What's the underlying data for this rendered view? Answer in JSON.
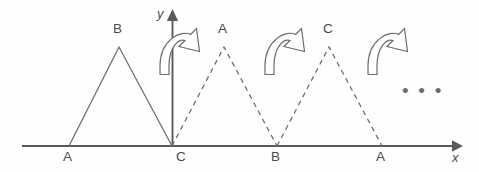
{
  "figure": {
    "background_color": "#fefefe",
    "stroke_color": "#6b6b6b",
    "axis_color": "#5a5a5a",
    "width": 479,
    "height": 172,
    "axes": {
      "x_label": "x",
      "y_label": "y",
      "baseline_y": 146,
      "origin_x": 172
    },
    "ellipsis": "• • •",
    "triangles": [
      {
        "id": "triangle-1",
        "style": "solid",
        "vertices": [
          {
            "label": "A",
            "x": 69,
            "y": 146,
            "position": "bottom-left"
          },
          {
            "label": "B",
            "x": 119,
            "y": 47,
            "position": "apex"
          },
          {
            "label": "C",
            "x": 172,
            "y": 146,
            "position": "bottom-right"
          }
        ]
      },
      {
        "id": "triangle-2",
        "style": "dashed",
        "vertices": [
          {
            "label": "C",
            "x": 172,
            "y": 146,
            "position": "bottom-left"
          },
          {
            "label": "A",
            "x": 224,
            "y": 47,
            "position": "apex"
          },
          {
            "label": "B",
            "x": 277,
            "y": 146,
            "position": "bottom-right"
          }
        ]
      },
      {
        "id": "triangle-3",
        "style": "dashed",
        "vertices": [
          {
            "label": "B",
            "x": 277,
            "y": 146,
            "position": "bottom-left"
          },
          {
            "label": "C",
            "x": 329,
            "y": 47,
            "position": "apex"
          },
          {
            "label": "A",
            "x": 382,
            "y": 146,
            "position": "bottom-right"
          }
        ]
      }
    ],
    "labels": {
      "apex_1": "B",
      "apex_2": "A",
      "apex_3": "C",
      "base_1": "A",
      "base_2": "C",
      "base_3": "B",
      "base_4": "A",
      "y_axis": "y",
      "x_axis": "x"
    },
    "rotation_arrows": [
      {
        "id": "rotation-arrow-1",
        "cx": 182,
        "cy": 50,
        "direction": "clockwise"
      },
      {
        "id": "rotation-arrow-2",
        "cx": 287,
        "cy": 50,
        "direction": "clockwise"
      },
      {
        "id": "rotation-arrow-3",
        "cx": 390,
        "cy": 50,
        "direction": "clockwise"
      }
    ]
  }
}
